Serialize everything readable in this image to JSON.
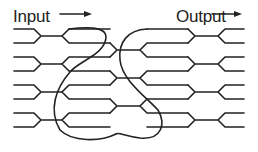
{
  "labels": {
    "input": "Input",
    "output": "Output"
  },
  "icons": {
    "input_arrow": "arrow-right-icon",
    "output_arrow": "arrow-right-icon"
  },
  "diagram": {
    "type": "optical switch / butterfly network",
    "input_ports": 8,
    "output_ports": 8,
    "stroke_color": "#222222",
    "background_color": "#ffffff"
  }
}
